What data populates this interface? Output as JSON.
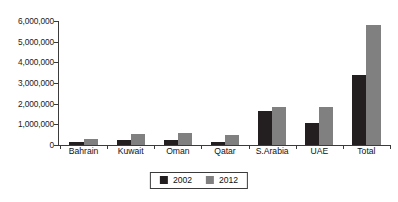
{
  "chart_data": {
    "type": "bar",
    "title": "",
    "subtitle": "",
    "xlabel": "",
    "ylabel": "",
    "categories": [
      "Bahrain",
      "Kuwait",
      "Oman",
      "Qatar",
      "S.Arabia",
      "UAE",
      "Total"
    ],
    "series": [
      {
        "name": "2002",
        "color": "#231f20",
        "values": [
          150000,
          250000,
          250000,
          150000,
          1650000,
          1050000,
          3400000
        ]
      },
      {
        "name": "2012",
        "color": "#808080",
        "values": [
          300000,
          550000,
          600000,
          500000,
          1850000,
          1850000,
          5800000
        ]
      }
    ],
    "ylim": [
      0,
      6000000
    ],
    "ytick_values": [
      0,
      1000000,
      2000000,
      3000000,
      4000000,
      5000000,
      6000000
    ],
    "ytick_labels": [
      "0",
      "1,000,000",
      "2,000,000",
      "3,000,000",
      "4,000,000",
      "5,000,000",
      "6,000,000"
    ],
    "grid": false,
    "legend_position": "bottom-center",
    "axis_color": "#3b3b3b",
    "background_color": "#ffffff"
  }
}
